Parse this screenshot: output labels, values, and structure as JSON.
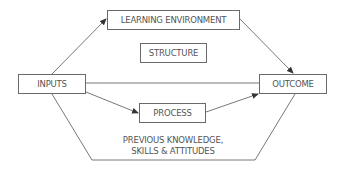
{
  "diagram": {
    "nodes": {
      "learning_environment": "LEARNING ENVIRONMENT",
      "structure": "STRUCTURE",
      "inputs": "INPUTS",
      "outcome": "OUTCOME",
      "process": "PROCESS"
    },
    "bottom_label": {
      "line1": "PREVIOUS KNOWLEDGE,",
      "line2": "SKILLS & ATTITUDES"
    },
    "edges": [
      {
        "from": "INPUTS",
        "to": "LEARNING ENVIRONMENT",
        "arrow": true
      },
      {
        "from": "LEARNING ENVIRONMENT",
        "to": "OUTCOME",
        "arrow": true
      },
      {
        "from": "INPUTS",
        "to": "OUTCOME",
        "arrow": false
      },
      {
        "from": "INPUTS",
        "to": "PROCESS",
        "arrow": true
      },
      {
        "from": "PROCESS",
        "to": "OUTCOME",
        "arrow": true
      },
      {
        "from": "INPUTS",
        "to": "OUTCOME",
        "via": "PREVIOUS KNOWLEDGE, SKILLS & ATTITUDES",
        "arrow": false
      }
    ],
    "colors": {
      "line": "#555555",
      "text": "#555555",
      "border": "#6a6a6a"
    }
  }
}
